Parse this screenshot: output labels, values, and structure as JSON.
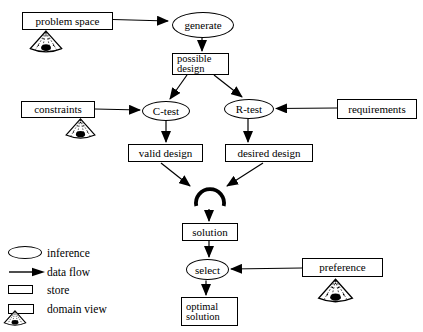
{
  "colors": {
    "ink": "#000000",
    "paper": "#ffffff"
  },
  "nodes": {
    "problem_space": "problem space",
    "generate": "generate",
    "possible_design": "possible\ndesign",
    "constraints": "constraints",
    "c_test": "C-test",
    "r_test": "R-test",
    "requirements": "requirements",
    "valid_design": "valid design",
    "desired_design": "desired design",
    "solution": "solution",
    "select": "select",
    "preference": "preference",
    "optimal_solution": "optimal\nsolution"
  },
  "edges": [
    {
      "from": "problem space",
      "to": "generate"
    },
    {
      "from": "generate",
      "to": "possible design"
    },
    {
      "from": "possible design",
      "to": "C-test"
    },
    {
      "from": "possible design",
      "to": "R-test"
    },
    {
      "from": "constraints",
      "to": "C-test"
    },
    {
      "from": "requirements",
      "to": "R-test"
    },
    {
      "from": "C-test",
      "to": "valid design"
    },
    {
      "from": "R-test",
      "to": "desired design"
    },
    {
      "from": "valid design",
      "to": "store-junction"
    },
    {
      "from": "desired design",
      "to": "store-junction"
    },
    {
      "from": "store-junction",
      "to": "solution"
    },
    {
      "from": "solution",
      "to": "select"
    },
    {
      "from": "preference",
      "to": "select"
    },
    {
      "from": "select",
      "to": "optimal solution"
    }
  ],
  "domain_view_markers": [
    "problem space",
    "constraints",
    "preference"
  ],
  "legend": {
    "inference": "inference",
    "data_flow": "data flow",
    "store": "store",
    "domain_view": "domain view"
  }
}
